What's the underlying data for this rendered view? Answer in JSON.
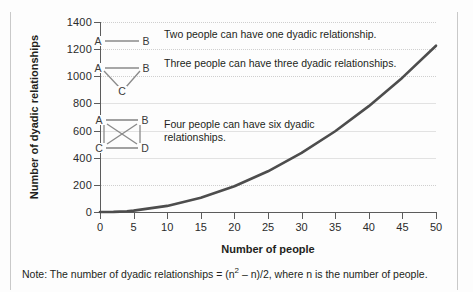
{
  "chart_data": {
    "type": "line",
    "title": "",
    "xlabel": "Number of people",
    "ylabel": "Number of dyadic relationships",
    "xlim": [
      0,
      50
    ],
    "ylim": [
      0,
      1400
    ],
    "xticks": [
      0,
      5,
      10,
      15,
      20,
      25,
      30,
      35,
      40,
      45,
      50
    ],
    "yticks": [
      0,
      200,
      400,
      600,
      800,
      1000,
      1200,
      1400
    ],
    "grid": "horizontal-dotted",
    "legend": "none",
    "series": [
      {
        "name": "Number of dyadic relationships = (n² − n)/2",
        "color": "#4d4d4d",
        "x": [
          0,
          2,
          3,
          4,
          5,
          10,
          15,
          20,
          25,
          30,
          35,
          40,
          45,
          50
        ],
        "values": [
          0,
          1,
          3,
          6,
          10,
          45,
          105,
          190,
          300,
          435,
          595,
          780,
          990,
          1225
        ]
      }
    ],
    "annotations": [
      {
        "diagram": "two-node-graph",
        "nodes": [
          "A",
          "B"
        ],
        "edges": 1,
        "text": "Two people can have one dyadic relationship."
      },
      {
        "diagram": "three-node-graph",
        "nodes": [
          "A",
          "B",
          "C"
        ],
        "edges": 3,
        "text": "Three people can have three dyadic relationships."
      },
      {
        "diagram": "four-node-graph",
        "nodes": [
          "A",
          "B",
          "C",
          "D"
        ],
        "edges": 6,
        "text": "Four people can have six dyadic relationships."
      }
    ],
    "note": "Note: The number of dyadic relationships = (n² – n)/2, where n is the number of people."
  },
  "axes": {
    "y_title": "Number of dyadic relationships",
    "x_title": "Number of people",
    "y_tick_labels": [
      "1400",
      "1200",
      "1000",
      "800",
      "600",
      "400",
      "200",
      "0"
    ],
    "x_tick_labels": [
      "0",
      "5",
      "10",
      "15",
      "20",
      "25",
      "30",
      "35",
      "40",
      "45",
      "50"
    ]
  },
  "legend_items": [
    {
      "label_a": "A",
      "label_b": "B",
      "text": "Two people can have one dyadic relationship."
    },
    {
      "label_a": "A",
      "label_b": "B",
      "label_c": "C",
      "text": "Three people can have three dyadic relationships."
    },
    {
      "label_a": "A",
      "label_b": "B",
      "label_c": "C",
      "label_d": "D",
      "text_line1": "Four people can have six dyadic",
      "text_line2": "relationships."
    }
  ],
  "note": {
    "prefix": "Note:",
    "body_before": " The number of dyadic relationships = (n",
    "exponent": "2",
    "body_after": " – n)/2, where n is the number of people."
  },
  "colors": {
    "line": "#4d4d4d",
    "axis": "#5c5c5c",
    "grid": "#cfcfcf",
    "text": "#231f20",
    "diagram_edge": "#8a8a8a",
    "frame": "#c9c9c9"
  }
}
